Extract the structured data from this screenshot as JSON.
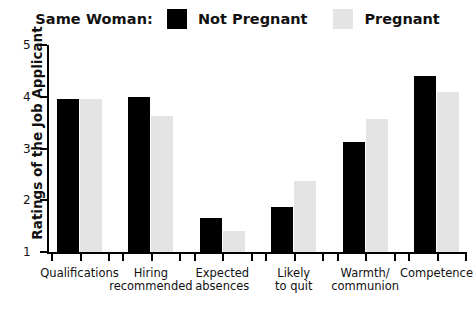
{
  "legend": {
    "title": "Same Woman:",
    "entries": [
      {
        "label": "Not Pregnant",
        "color": "#000000",
        "swatch_name": "legend-swatch-not-pregnant"
      },
      {
        "label": "Pregnant",
        "color": "#e4e4e4",
        "swatch_name": "legend-swatch-pregnant"
      }
    ]
  },
  "axes": {
    "ylabel": "Ratings of the Job Applicant",
    "yticks": [
      "1",
      "2",
      "3",
      "4",
      "5"
    ],
    "xlabel": ""
  },
  "chart_data": {
    "type": "bar",
    "title": "",
    "subtitle": "",
    "xlabel": "",
    "ylabel": "Ratings of the Job Applicant",
    "ylim": [
      1,
      5
    ],
    "yticks": [
      1,
      2,
      3,
      4,
      5
    ],
    "grid": false,
    "legend_position": "top-center",
    "legend_title": "Same Woman:",
    "categories": [
      "Qualifications",
      "Hiring\nrecommended",
      "Expected\nabsences",
      "Likely\nto quit",
      "Warmth/\ncommunion",
      "Competence"
    ],
    "series": [
      {
        "name": "Not Pregnant",
        "color": "#000000",
        "values": [
          3.95,
          4.0,
          1.66,
          1.87,
          3.12,
          4.4
        ]
      },
      {
        "name": "Pregnant",
        "color": "#e4e4e4",
        "values": [
          3.96,
          3.62,
          1.4,
          2.38,
          3.57,
          4.1
        ]
      }
    ]
  }
}
